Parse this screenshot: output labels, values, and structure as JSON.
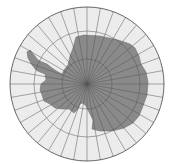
{
  "map": {
    "projection": "south-polar-azimuthal",
    "subject": "Antarctica",
    "center": [
      87,
      84
    ],
    "outer_radius": 77,
    "latitude_circle_radii": [
      53,
      25
    ],
    "meridian_step_deg": 10,
    "colors": {
      "ocean": "#ececec",
      "land": "#8a8a8a",
      "grid": "#555555",
      "border": "#444444"
    }
  }
}
